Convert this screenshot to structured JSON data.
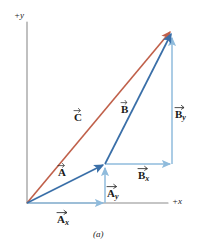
{
  "figure": {
    "caption": "(a)",
    "background_color": "#ffffff"
  },
  "axes": {
    "y_label": "+y",
    "x_label": "+x",
    "color": "#8c8c8c",
    "origin": {
      "x": 27,
      "y": 203
    },
    "y_top": {
      "x": 27,
      "y": 22
    },
    "x_right": {
      "x": 168,
      "y": 203
    }
  },
  "colors": {
    "resultant": "#c0604a",
    "vector": "#3a6fa8",
    "component": "#8fbbdc",
    "axis": "#8c8c8c",
    "text": "#1a1a1a"
  },
  "vectors": [
    {
      "id": "A",
      "label": "A",
      "subscript": "",
      "kind": "vector",
      "color": "#3a6fa8",
      "start": {
        "x": 27,
        "y": 203
      },
      "end": {
        "x": 105,
        "y": 164
      },
      "label_pos": {
        "x": 63,
        "y": 168
      }
    },
    {
      "id": "B",
      "label": "B",
      "subscript": "",
      "kind": "vector",
      "color": "#3a6fa8",
      "start": {
        "x": 105,
        "y": 164
      },
      "end": {
        "x": 172,
        "y": 32
      },
      "label_pos": {
        "x": 125,
        "y": 105
      }
    },
    {
      "id": "C",
      "label": "C",
      "subscript": "",
      "kind": "resultant",
      "color": "#c0604a",
      "start": {
        "x": 27,
        "y": 203
      },
      "end": {
        "x": 172,
        "y": 30
      },
      "label_pos": {
        "x": 80,
        "y": 113
      }
    },
    {
      "id": "Ax",
      "label": "A",
      "subscript": "x",
      "kind": "component",
      "color": "#8fbbdc",
      "start": {
        "x": 27,
        "y": 203
      },
      "end": {
        "x": 105,
        "y": 203
      },
      "label_pos": {
        "x": 63,
        "y": 216
      }
    },
    {
      "id": "Ay",
      "label": "A",
      "subscript": "y",
      "kind": "component",
      "color": "#8fbbdc",
      "start": {
        "x": 105,
        "y": 203
      },
      "end": {
        "x": 105,
        "y": 166
      },
      "label_pos": {
        "x": 112,
        "y": 190
      }
    },
    {
      "id": "Bx",
      "label": "B",
      "subscript": "x",
      "kind": "component",
      "color": "#8fbbdc",
      "start": {
        "x": 105,
        "y": 164
      },
      "end": {
        "x": 172,
        "y": 164
      },
      "label_pos": {
        "x": 143,
        "y": 172
      }
    },
    {
      "id": "By",
      "label": "B",
      "subscript": "y",
      "kind": "component",
      "color": "#8fbbdc",
      "start": {
        "x": 172,
        "y": 164
      },
      "end": {
        "x": 172,
        "y": 36
      },
      "label_pos": {
        "x": 180,
        "y": 110
      }
    }
  ]
}
